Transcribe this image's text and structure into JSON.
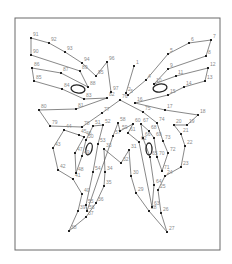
{
  "puzzle": {
    "title": "Butterfly dot-to-dot",
    "frame": {
      "x": 15,
      "y": 18,
      "w": 205,
      "h": 232
    },
    "points": [
      {
        "n": "1",
        "x": 134,
        "y": 66
      },
      {
        "n": "2",
        "x": 126,
        "y": 93
      },
      {
        "n": "3",
        "x": 128,
        "y": 95
      },
      {
        "n": "4",
        "x": 146,
        "y": 80
      },
      {
        "n": "5",
        "x": 168,
        "y": 54
      },
      {
        "n": "6",
        "x": 189,
        "y": 43
      },
      {
        "n": "7",
        "x": 211,
        "y": 40
      },
      {
        "n": "8",
        "x": 206,
        "y": 56
      },
      {
        "n": "9",
        "x": 168,
        "y": 69
      },
      {
        "n": "10",
        "x": 154,
        "y": 84
      },
      {
        "n": "11",
        "x": 176,
        "y": 76
      },
      {
        "n": "12",
        "x": 208,
        "y": 68
      },
      {
        "n": "13",
        "x": 205,
        "y": 81
      },
      {
        "n": "14",
        "x": 184,
        "y": 87
      },
      {
        "n": "15",
        "x": 168,
        "y": 95
      },
      {
        "n": "16",
        "x": 135,
        "y": 103
      },
      {
        "n": "17",
        "x": 165,
        "y": 110
      },
      {
        "n": "18",
        "x": 198,
        "y": 115
      },
      {
        "n": "19",
        "x": 187,
        "y": 125
      },
      {
        "n": "20",
        "x": 174,
        "y": 125
      },
      {
        "n": "21",
        "x": 181,
        "y": 134
      },
      {
        "n": "22",
        "x": 185,
        "y": 146
      },
      {
        "n": "23",
        "x": 181,
        "y": 167
      },
      {
        "n": "24",
        "x": 165,
        "y": 176
      },
      {
        "n": "25",
        "x": 158,
        "y": 190
      },
      {
        "n": "26",
        "x": 161,
        "y": 213
      },
      {
        "n": "27",
        "x": 167,
        "y": 232
      },
      {
        "n": "28",
        "x": 149,
        "y": 211
      },
      {
        "n": "29",
        "x": 136,
        "y": 193
      },
      {
        "n": "30",
        "x": 131,
        "y": 176
      },
      {
        "n": "31",
        "x": 129,
        "y": 150
      },
      {
        "n": "32",
        "x": 121,
        "y": 163
      },
      {
        "n": "33",
        "x": 104,
        "y": 149
      },
      {
        "n": "34",
        "x": 105,
        "y": 172
      },
      {
        "n": "35",
        "x": 104,
        "y": 186
      },
      {
        "n": "36",
        "x": 96,
        "y": 203
      },
      {
        "n": "37",
        "x": 86,
        "y": 217
      },
      {
        "n": "38",
        "x": 69,
        "y": 231
      },
      {
        "n": "39",
        "x": 78,
        "y": 211
      },
      {
        "n": "40",
        "x": 82,
        "y": 194
      },
      {
        "n": "41",
        "x": 73,
        "y": 179
      },
      {
        "n": "42",
        "x": 58,
        "y": 170
      },
      {
        "n": "43",
        "x": 53,
        "y": 148
      },
      {
        "n": "44",
        "x": 64,
        "y": 130
      },
      {
        "n": "45",
        "x": 79,
        "y": 135
      },
      {
        "n": "46",
        "x": 84,
        "y": 137
      },
      {
        "n": "47",
        "x": 75,
        "y": 153
      },
      {
        "n": "48",
        "x": 76,
        "y": 173
      },
      {
        "n": "49",
        "x": 82,
        "y": 156
      },
      {
        "n": "50",
        "x": 86,
        "y": 140
      },
      {
        "n": "51",
        "x": 93,
        "y": 126
      },
      {
        "n": "52",
        "x": 103,
        "y": 125
      },
      {
        "n": "53",
        "x": 98,
        "y": 144
      },
      {
        "n": "54",
        "x": 93,
        "y": 172
      },
      {
        "n": "55",
        "x": 86,
        "y": 205
      },
      {
        "n": "56",
        "x": 87,
        "y": 211
      },
      {
        "n": "57",
        "x": 113,
        "y": 136
      },
      {
        "n": "58",
        "x": 118,
        "y": 123
      },
      {
        "n": "59",
        "x": 120,
        "y": 131
      },
      {
        "n": "60",
        "x": 133,
        "y": 124
      },
      {
        "n": "61",
        "x": 128,
        "y": 133
      },
      {
        "n": "62",
        "x": 139,
        "y": 142
      },
      {
        "n": "63",
        "x": 152,
        "y": 207
      },
      {
        "n": "64",
        "x": 154,
        "y": 185
      },
      {
        "n": "65",
        "x": 150,
        "y": 157
      },
      {
        "n": "66",
        "x": 143,
        "y": 138
      },
      {
        "n": "67",
        "x": 141,
        "y": 124
      },
      {
        "n": "68",
        "x": 149,
        "y": 131
      },
      {
        "n": "69",
        "x": 154,
        "y": 138
      },
      {
        "n": "70",
        "x": 157,
        "y": 157
      },
      {
        "n": "71",
        "x": 162,
        "y": 171
      },
      {
        "n": "72",
        "x": 168,
        "y": 153
      },
      {
        "n": "73",
        "x": 163,
        "y": 141
      },
      {
        "n": "74",
        "x": 157,
        "y": 123
      },
      {
        "n": "75",
        "x": 143,
        "y": 112
      },
      {
        "n": "76",
        "x": 120,
        "y": 100
      },
      {
        "n": "77",
        "x": 102,
        "y": 113
      },
      {
        "n": "78",
        "x": 82,
        "y": 127
      },
      {
        "n": "79",
        "x": 50,
        "y": 126
      },
      {
        "n": "80",
        "x": 39,
        "y": 110
      },
      {
        "n": "81",
        "x": 76,
        "y": 109
      },
      {
        "n": "82",
        "x": 107,
        "y": 98
      },
      {
        "n": "83",
        "x": 84,
        "y": 99
      },
      {
        "n": "84",
        "x": 62,
        "y": 89
      },
      {
        "n": "85",
        "x": 34,
        "y": 81
      },
      {
        "n": "86",
        "x": 32,
        "y": 68
      },
      {
        "n": "87",
        "x": 61,
        "y": 73
      },
      {
        "n": "88",
        "x": 88,
        "y": 87
      },
      {
        "n": "89",
        "x": 80,
        "y": 71
      },
      {
        "n": "90",
        "x": 31,
        "y": 55
      },
      {
        "n": "91",
        "x": 31,
        "y": 38
      },
      {
        "n": "92",
        "x": 49,
        "y": 43
      },
      {
        "n": "93",
        "x": 65,
        "y": 52
      },
      {
        "n": "94",
        "x": 82,
        "y": 63
      },
      {
        "n": "95",
        "x": 96,
        "y": 76
      },
      {
        "n": "96",
        "x": 107,
        "y": 62
      },
      {
        "n": "97",
        "x": 111,
        "y": 92
      }
    ],
    "eyes": [
      {
        "name": "left-forewing-spot",
        "cx": 78,
        "cy": 89,
        "rx": 7,
        "ry": 4,
        "rot": 10
      },
      {
        "name": "right-forewing-spot",
        "cx": 160,
        "cy": 88,
        "rx": 7,
        "ry": 4,
        "rot": -10
      },
      {
        "name": "left-hindwing-spot",
        "cx": 89,
        "cy": 149,
        "rx": 3,
        "ry": 6,
        "rot": 15
      },
      {
        "name": "right-hindwing-spot",
        "cx": 149,
        "cy": 149,
        "rx": 3,
        "ry": 6,
        "rot": 0
      }
    ],
    "colors": {
      "line": "#555555",
      "dot": "#222222",
      "label": "#8a8a8a",
      "frame": "#6a6a6a"
    }
  }
}
